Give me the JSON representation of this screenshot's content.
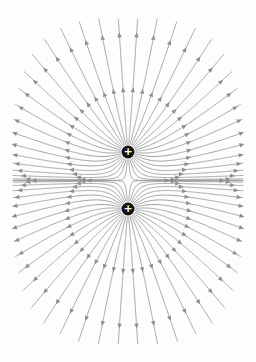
{
  "diagram": {
    "width": 256,
    "height": 362,
    "background": "#fdfdfd",
    "line_color": "#9a9a9a",
    "arrow_color": "#8e8e8e",
    "charge_color": "#111111",
    "charge_radius": 6.5,
    "lines_per_charge": 36,
    "bounds": {
      "x0": 12,
      "y0": 18,
      "x1": 244,
      "y1": 345
    },
    "arrow_distances": [
      55,
      110
    ],
    "charges": [
      {
        "id": "upper",
        "x": 128,
        "y": 152,
        "sign": "+",
        "label": "+"
      },
      {
        "id": "lower",
        "x": 128,
        "y": 209,
        "sign": "+",
        "label": "+"
      }
    ],
    "field_direction": "outward"
  }
}
